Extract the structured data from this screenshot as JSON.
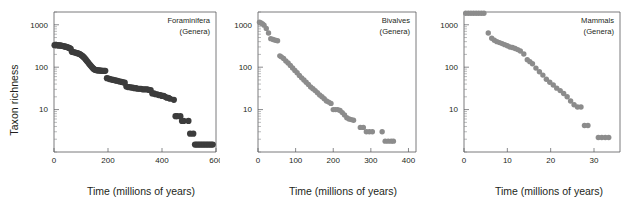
{
  "figure": {
    "shared_ylabel": "Taxon richness",
    "shared_xlabel": "Time (millions of years)"
  },
  "chart_data": [
    {
      "type": "scatter",
      "title": "Foraminifera",
      "subtitle": "(Genera)",
      "xlabel": "Time (millions of years)",
      "ylabel": "Taxon richness",
      "yscale": "log",
      "xlim": [
        0,
        600
      ],
      "ylim": [
        1,
        2000
      ],
      "xticks": [
        0,
        200,
        400,
        600
      ],
      "xtick_labels": [
        "0",
        "200",
        "400",
        "600"
      ],
      "yticks": [
        10,
        100,
        1000
      ],
      "ytick_labels": [
        "10",
        "100",
        "1000"
      ],
      "grid": false,
      "legend": "none",
      "point_color": "#3c3c3c",
      "x": [
        2,
        6,
        10,
        14,
        18,
        22,
        26,
        30,
        34,
        38,
        42,
        46,
        50,
        54,
        58,
        62,
        66,
        70,
        74,
        78,
        82,
        86,
        90,
        94,
        98,
        102,
        106,
        110,
        114,
        118,
        122,
        126,
        130,
        134,
        138,
        142,
        146,
        150,
        154,
        158,
        162,
        166,
        170,
        174,
        178,
        182,
        186,
        190,
        196,
        202,
        208,
        214,
        220,
        226,
        232,
        238,
        244,
        250,
        256,
        262,
        268,
        274,
        280,
        286,
        292,
        298,
        304,
        310,
        316,
        322,
        328,
        334,
        340,
        346,
        352,
        358,
        364,
        370,
        376,
        382,
        388,
        394,
        400,
        406,
        412,
        418,
        424,
        430,
        444,
        450,
        456,
        468,
        474,
        480,
        498,
        504,
        516,
        522,
        528,
        534,
        540,
        546,
        552,
        558,
        564,
        570,
        576,
        582,
        588
      ],
      "y": [
        330,
        332,
        330,
        328,
        326,
        325,
        322,
        318,
        315,
        310,
        305,
        300,
        295,
        288,
        280,
        272,
        232,
        228,
        225,
        222,
        218,
        214,
        210,
        205,
        198,
        190,
        182,
        172,
        162,
        150,
        140,
        130,
        120,
        112,
        105,
        98,
        92,
        88,
        86,
        85,
        84,
        84,
        83,
        83,
        82,
        82,
        82,
        82,
        55,
        54,
        52,
        51,
        50,
        49,
        48,
        47,
        46,
        45,
        44,
        43,
        35,
        34,
        34,
        33,
        33,
        32,
        32,
        31,
        31,
        31,
        30,
        30,
        30,
        30,
        29,
        29,
        24,
        24,
        23,
        23,
        22,
        22,
        21,
        21,
        20,
        19,
        19,
        18,
        17,
        7,
        7,
        7,
        5.4,
        5.4,
        5.4,
        2.7,
        2.7,
        1.5,
        1.5,
        1.5,
        1.5,
        1.5,
        1.5,
        1.5,
        1.5,
        1.5,
        1.5,
        1.5,
        1.5,
        1.5
      ]
    },
    {
      "type": "scatter",
      "title": "Bivalves",
      "subtitle": "(Genera)",
      "xlabel": "Time (millions of years)",
      "ylabel": "Taxon richness",
      "yscale": "log",
      "xlim": [
        0,
        420
      ],
      "ylim": [
        1,
        2000
      ],
      "xticks": [
        0,
        100,
        200,
        300,
        400
      ],
      "xtick_labels": [
        "0",
        "100",
        "200",
        "300",
        "400"
      ],
      "yticks": [
        10,
        100,
        1000
      ],
      "ytick_labels": [
        "10",
        "100",
        "1000"
      ],
      "grid": false,
      "legend": "none",
      "point_color": "#8c8c8c",
      "x": [
        4,
        8,
        12,
        16,
        22,
        28,
        34,
        40,
        46,
        52,
        58,
        62,
        68,
        74,
        80,
        86,
        92,
        98,
        104,
        110,
        116,
        122,
        128,
        134,
        140,
        146,
        152,
        158,
        164,
        170,
        176,
        182,
        188,
        194,
        200,
        206,
        212,
        218,
        224,
        230,
        236,
        242,
        248,
        254,
        272,
        280,
        288,
        296,
        304,
        330,
        338,
        346,
        354,
        360
      ],
      "y": [
        1150,
        1100,
        1050,
        980,
        820,
        640,
        470,
        450,
        430,
        420,
        185,
        175,
        160,
        140,
        125,
        110,
        96,
        84,
        74,
        64,
        56,
        50,
        44,
        39,
        34,
        31,
        28,
        25,
        22,
        20,
        18,
        16,
        15,
        14,
        10,
        10,
        10,
        9.5,
        8.5,
        7.5,
        6.4,
        6.0,
        5.8,
        5.6,
        3.8,
        3.8,
        3.0,
        3.0,
        3.0,
        3.0,
        1.8,
        1.8,
        1.8,
        1.8
      ]
    },
    {
      "type": "scatter",
      "title": "Mammals",
      "subtitle": "(Genera)",
      "xlabel": "Time (millions of years)",
      "ylabel": "Taxon richness",
      "yscale": "log",
      "xlim": [
        0,
        36
      ],
      "ylim": [
        1,
        2000
      ],
      "xticks": [
        0,
        10,
        20,
        30
      ],
      "xtick_labels": [
        "0",
        "10",
        "20",
        "30"
      ],
      "yticks": [
        10,
        100,
        1000
      ],
      "ytick_labels": [
        "10",
        "100",
        "1000"
      ],
      "grid": false,
      "legend": "none",
      "point_color": "#8c8c8c",
      "x": [
        0.4,
        1.0,
        1.6,
        2.2,
        2.8,
        3.4,
        4.0,
        4.6,
        5.6,
        6.4,
        7.0,
        7.6,
        8.2,
        8.8,
        9.4,
        10.0,
        10.6,
        11.2,
        11.8,
        12.4,
        13.0,
        13.8,
        14.6,
        15.2,
        15.8,
        16.6,
        17.4,
        18.2,
        19.0,
        19.8,
        20.6,
        21.4,
        22.2,
        23.0,
        23.8,
        24.6,
        25.4,
        26.2,
        27.0,
        27.8,
        28.6,
        31.0,
        31.8,
        32.6,
        33.4
      ],
      "y": [
        1900,
        1900,
        1900,
        1900,
        1900,
        1900,
        1900,
        1900,
        640,
        480,
        430,
        400,
        380,
        360,
        340,
        320,
        300,
        290,
        275,
        260,
        240,
        205,
        150,
        135,
        120,
        95,
        78,
        65,
        52,
        44,
        38,
        32,
        28,
        24,
        20,
        16,
        13,
        11.5,
        11.5,
        4.2,
        4.2,
        2.2,
        2.2,
        2.2,
        2.2
      ]
    }
  ]
}
